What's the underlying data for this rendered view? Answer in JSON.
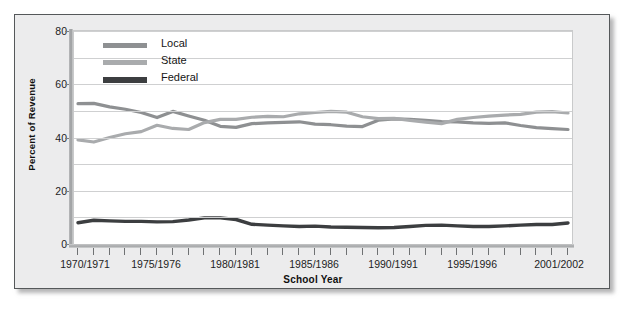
{
  "figure": {
    "background": "#ececed",
    "plot_background": "#ffffff",
    "border_color": "#55585a"
  },
  "axis_titles": {
    "x": "School Year",
    "y": "Percent of Revenue"
  },
  "legend": {
    "position": "top-left-inside",
    "entries": [
      {
        "label": "Local",
        "color": "#8e9092"
      },
      {
        "label": "State",
        "color": "#a9abad"
      },
      {
        "label": "Federal",
        "color": "#3c3e40"
      }
    ]
  },
  "y_ticks": [
    "0",
    "20",
    "40",
    "60",
    "80"
  ],
  "x_tick_labels": [
    "1970/1971",
    "1975/1976",
    "1980/1981",
    "1985/1986",
    "1990/1991",
    "1995/1996",
    "2001/2002"
  ],
  "chart_data": {
    "type": "line",
    "title": "",
    "xlabel": "School Year",
    "ylabel": "Percent of Revenue",
    "ylim": [
      0,
      80
    ],
    "yticks": [
      0,
      20,
      40,
      60,
      80
    ],
    "gridlines": [
      0,
      10,
      20,
      30,
      40,
      50,
      60,
      70,
      80
    ],
    "grid": true,
    "legend_position": "upper left",
    "x": [
      "1970/1971",
      "1971/1972",
      "1972/1973",
      "1973/1974",
      "1974/1975",
      "1975/1976",
      "1976/1977",
      "1977/1978",
      "1978/1979",
      "1979/1980",
      "1980/1981",
      "1981/1982",
      "1982/1983",
      "1983/1984",
      "1984/1985",
      "1985/1986",
      "1986/1987",
      "1987/1988",
      "1988/1989",
      "1989/1990",
      "1990/1991",
      "1991/1992",
      "1992/1993",
      "1993/1994",
      "1994/1995",
      "1995/1996",
      "1996/1997",
      "1997/1998",
      "1998/1999",
      "1999/2000",
      "2000/2001",
      "2001/2002"
    ],
    "x_major_label_indices": [
      0,
      5,
      10,
      15,
      20,
      25,
      31
    ],
    "series": [
      {
        "name": "Local",
        "color": "#8e9092",
        "values": [
          52.7,
          52.8,
          51.5,
          50.6,
          49.4,
          47.5,
          49.8,
          48.1,
          46.5,
          44.2,
          43.8,
          45.2,
          45.5,
          45.7,
          45.9,
          45.0,
          44.8,
          44.3,
          44.1,
          46.5,
          47.0,
          46.8,
          46.4,
          46.0,
          45.9,
          45.5,
          45.3,
          45.5,
          44.5,
          43.7,
          43.3,
          43.0
        ]
      },
      {
        "name": "State",
        "color": "#a9abad",
        "values": [
          39.1,
          38.3,
          40.0,
          41.4,
          42.2,
          44.6,
          43.4,
          43.0,
          45.6,
          46.8,
          46.8,
          47.6,
          47.9,
          47.8,
          48.9,
          49.4,
          49.8,
          49.5,
          47.8,
          47.1,
          47.2,
          46.4,
          45.8,
          45.2,
          46.8,
          47.5,
          48.0,
          48.4,
          48.7,
          49.5,
          49.7,
          49.2
        ]
      },
      {
        "name": "Federal",
        "color": "#3c3e40",
        "values": [
          8.0,
          8.9,
          8.7,
          8.5,
          8.5,
          8.3,
          8.4,
          9.0,
          9.8,
          9.8,
          9.2,
          7.4,
          7.1,
          6.8,
          6.6,
          6.7,
          6.4,
          6.3,
          6.2,
          6.1,
          6.2,
          6.6,
          7.0,
          7.1,
          6.8,
          6.6,
          6.6,
          6.8,
          7.1,
          7.3,
          7.3,
          7.9
        ]
      }
    ]
  }
}
